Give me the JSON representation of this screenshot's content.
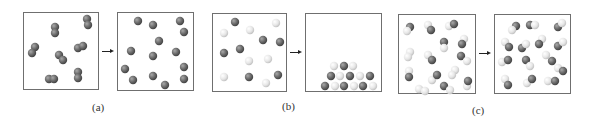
{
  "panels": [
    {
      "id": "a",
      "label": "(a)",
      "label_x": 92,
      "label_y": 101,
      "arrow_x": 102,
      "arrow_y": 51
    },
    {
      "id": "b",
      "label": "(b)",
      "label_x": 282,
      "label_y": 100,
      "arrow_x": 290,
      "arrow_y": 52
    },
    {
      "id": "c",
      "label": "(c)",
      "label_x": 472,
      "label_y": 104,
      "arrow_x": 479,
      "arrow_y": 53
    }
  ],
  "boxes": [
    {
      "name": "box-a-before",
      "x": 23,
      "y": 12,
      "w": 76,
      "h": 78
    },
    {
      "name": "box-a-after",
      "x": 117,
      "y": 12,
      "w": 77,
      "h": 79
    },
    {
      "name": "box-b-before",
      "x": 212,
      "y": 13,
      "w": 75,
      "h": 79
    },
    {
      "name": "box-b-after",
      "x": 305,
      "y": 13,
      "w": 77,
      "h": 79
    },
    {
      "name": "box-c-before",
      "x": 398,
      "y": 14,
      "w": 78,
      "h": 80
    },
    {
      "name": "box-c-after",
      "x": 494,
      "y": 14,
      "w": 77,
      "h": 80
    }
  ],
  "colors": {
    "dark_atom": "#6a6a6a",
    "dark_atom_highlight": "#9a9a9a",
    "light_atom": "#e6e6e6",
    "light_atom_shadow": "#c4c4c4",
    "box_border": "#6f6f6f",
    "label": "#333333"
  },
  "atoms": {
    "radius": 4.2,
    "a_before": [
      [
        55,
        27,
        "d"
      ],
      [
        55,
        33,
        "d"
      ],
      [
        87,
        19,
        "d"
      ],
      [
        88,
        25,
        "d"
      ],
      [
        35,
        47,
        "d"
      ],
      [
        32,
        53,
        "d"
      ],
      [
        78,
        48,
        "d"
      ],
      [
        83,
        46,
        "d"
      ],
      [
        59,
        55,
        "d"
      ],
      [
        63,
        60,
        "d"
      ],
      [
        49,
        79,
        "d"
      ],
      [
        54,
        79,
        "d"
      ],
      [
        78,
        72,
        "d"
      ],
      [
        78,
        78,
        "d"
      ]
    ],
    "a_after": [
      [
        138,
        21,
        "d"
      ],
      [
        153,
        25,
        "d"
      ],
      [
        180,
        21,
        "d"
      ],
      [
        184,
        32,
        "d"
      ],
      [
        159,
        41,
        "d"
      ],
      [
        131,
        51,
        "d"
      ],
      [
        153,
        56,
        "d"
      ],
      [
        176,
        52,
        "d"
      ],
      [
        125,
        69,
        "d"
      ],
      [
        184,
        67,
        "d"
      ],
      [
        133,
        80,
        "d"
      ],
      [
        153,
        76,
        "d"
      ],
      [
        165,
        85,
        "d"
      ],
      [
        184,
        79,
        "d"
      ]
    ],
    "b_before": [
      [
        235,
        22,
        "d"
      ],
      [
        250,
        30,
        "l"
      ],
      [
        276,
        23,
        "l"
      ],
      [
        224,
        33,
        "l"
      ],
      [
        263,
        40,
        "d"
      ],
      [
        280,
        42,
        "d"
      ],
      [
        240,
        49,
        "d"
      ],
      [
        224,
        53,
        "d"
      ],
      [
        249,
        61,
        "l"
      ],
      [
        268,
        59,
        "l"
      ],
      [
        224,
        77,
        "l"
      ],
      [
        249,
        77,
        "d"
      ],
      [
        266,
        83,
        "l"
      ],
      [
        278,
        75,
        "d"
      ]
    ],
    "b_after": [
      [
        334,
        66,
        "l"
      ],
      [
        344,
        66,
        "d"
      ],
      [
        353,
        66,
        "l"
      ],
      [
        331,
        76,
        "d"
      ],
      [
        340,
        76,
        "l"
      ],
      [
        350,
        76,
        "d"
      ],
      [
        360,
        76,
        "l"
      ],
      [
        370,
        76,
        "d"
      ],
      [
        325,
        86,
        "d"
      ],
      [
        335,
        86,
        "l"
      ],
      [
        344,
        86,
        "d"
      ],
      [
        354,
        86,
        "l"
      ],
      [
        363,
        86,
        "d"
      ],
      [
        373,
        86,
        "l"
      ]
    ],
    "c_before": [
      [
        410,
        27,
        "d"
      ],
      [
        407,
        31,
        "l"
      ],
      [
        428,
        25,
        "l"
      ],
      [
        431,
        30,
        "d"
      ],
      [
        449,
        26,
        "l"
      ],
      [
        454,
        24,
        "d"
      ],
      [
        444,
        42,
        "d"
      ],
      [
        444,
        48,
        "l"
      ],
      [
        464,
        39,
        "l"
      ],
      [
        462,
        44,
        "d"
      ],
      [
        410,
        52,
        "l"
      ],
      [
        408,
        57,
        "l"
      ],
      [
        428,
        55,
        "l"
      ],
      [
        432,
        60,
        "d"
      ],
      [
        461,
        56,
        "d"
      ],
      [
        467,
        61,
        "l"
      ],
      [
        409,
        71,
        "l"
      ],
      [
        409,
        77,
        "d"
      ],
      [
        432,
        80,
        "l"
      ],
      [
        437,
        75,
        "d"
      ],
      [
        455,
        70,
        "l"
      ],
      [
        452,
        75,
        "l"
      ],
      [
        444,
        86,
        "d"
      ],
      [
        450,
        90,
        "l"
      ],
      [
        419,
        89,
        "l"
      ],
      [
        425,
        91,
        "l"
      ],
      [
        467,
        86,
        "l"
      ],
      [
        468,
        81,
        "d"
      ]
    ],
    "c_after": [
      [
        516,
        26,
        "d"
      ],
      [
        512,
        30,
        "l"
      ],
      [
        530,
        25,
        "d"
      ],
      [
        535,
        25,
        "l"
      ],
      [
        558,
        27,
        "d"
      ],
      [
        562,
        23,
        "l"
      ],
      [
        505,
        42,
        "l"
      ],
      [
        509,
        47,
        "d"
      ],
      [
        542,
        39,
        "l"
      ],
      [
        539,
        44,
        "d"
      ],
      [
        522,
        48,
        "d"
      ],
      [
        526,
        44,
        "l"
      ],
      [
        558,
        46,
        "d"
      ],
      [
        563,
        42,
        "l"
      ],
      [
        502,
        62,
        "l"
      ],
      [
        508,
        60,
        "d"
      ],
      [
        526,
        60,
        "d"
      ],
      [
        530,
        66,
        "l"
      ],
      [
        546,
        55,
        "l"
      ],
      [
        552,
        61,
        "d"
      ],
      [
        558,
        68,
        "l"
      ],
      [
        563,
        71,
        "d"
      ],
      [
        505,
        79,
        "l"
      ],
      [
        508,
        85,
        "d"
      ],
      [
        527,
        83,
        "l"
      ],
      [
        532,
        79,
        "d"
      ],
      [
        548,
        81,
        "l"
      ],
      [
        555,
        81,
        "d"
      ]
    ]
  }
}
